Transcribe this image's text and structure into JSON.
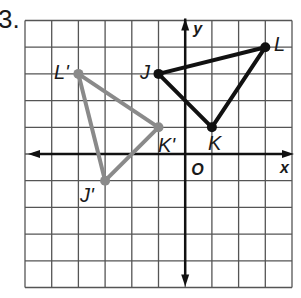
{
  "problem": {
    "number": "3."
  },
  "grid": {
    "left": 25,
    "top": 20.5,
    "cell": 26.7,
    "cols": 10,
    "rows": 10,
    "origin_col": 6,
    "origin_row": 5,
    "line_color": "#555555"
  },
  "axes": {
    "x_label": "x",
    "y_label": "y",
    "origin_label": "O",
    "color": "#111111"
  },
  "figures": {
    "original": {
      "color": "#111111",
      "vertices": [
        {
          "name": "J",
          "x": -1,
          "y": 3
        },
        {
          "name": "K",
          "x": 1,
          "y": 1
        },
        {
          "name": "L",
          "x": 3,
          "y": 4
        }
      ]
    },
    "image": {
      "color": "#8a8a8a",
      "vertices": [
        {
          "name": "J'",
          "x": -3,
          "y": -1
        },
        {
          "name": "K'",
          "x": -1,
          "y": 1
        },
        {
          "name": "L'",
          "x": -4,
          "y": 3
        }
      ]
    }
  }
}
